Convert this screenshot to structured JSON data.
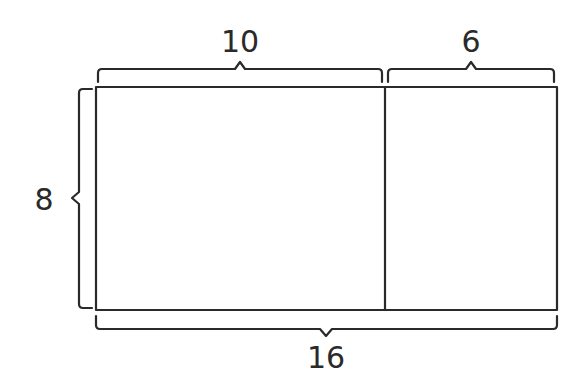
{
  "diagram": {
    "type": "area-model",
    "labels": {
      "top_left": "10",
      "top_right": "6",
      "left": "8",
      "bottom": "16"
    },
    "colors": {
      "stroke": "#2a2a2a",
      "background": "#ffffff"
    }
  }
}
